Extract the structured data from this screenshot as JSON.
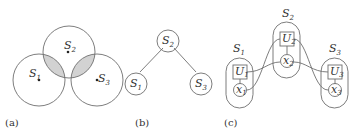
{
  "figure": {
    "panels": [
      {
        "id": "a",
        "caption": "(a)",
        "description": "Three overlapping circles; pairwise intersections S1∩S2 and S2∩S3 shaded gray",
        "nodes": [
          {
            "label": "S",
            "sub": "1"
          },
          {
            "label": "S",
            "sub": "2"
          },
          {
            "label": "S",
            "sub": "3"
          }
        ],
        "shade_color": "#d2d2d2"
      },
      {
        "id": "b",
        "caption": "(b)",
        "description": "Tree with S2 as root connected to S1 and S3",
        "nodes": [
          {
            "label": "S",
            "sub": "2"
          },
          {
            "label": "S",
            "sub": "1"
          },
          {
            "label": "S",
            "sub": "3"
          }
        ]
      },
      {
        "id": "c",
        "caption": "(c)",
        "description": "Three capsule groups, each with a square node U over a circle node x; cross connections between adjacent groups",
        "groups": [
          {
            "label": "S",
            "sub": "1",
            "u": {
              "label": "U",
              "sub": "1"
            },
            "x": {
              "label": "x",
              "sub": "1"
            }
          },
          {
            "label": "S",
            "sub": "2",
            "u": {
              "label": "U",
              "sub": "2"
            },
            "x": {
              "label": "x",
              "sub": "2"
            }
          },
          {
            "label": "S",
            "sub": "3",
            "u": {
              "label": "U",
              "sub": "3"
            },
            "x": {
              "label": "x",
              "sub": "3"
            }
          }
        ]
      }
    ],
    "line_color": "#6e6e6e"
  }
}
